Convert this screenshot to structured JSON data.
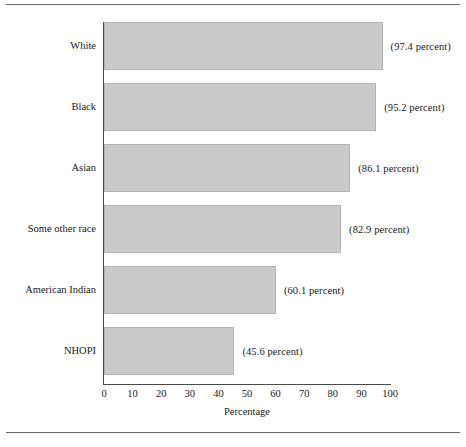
{
  "chart_data": {
    "type": "bar",
    "orientation": "horizontal",
    "title": "",
    "xlabel": "Percentage",
    "ylabel": "",
    "xlim": [
      0,
      100
    ],
    "xticks": [
      0,
      10,
      20,
      30,
      40,
      50,
      60,
      70,
      80,
      90,
      100
    ],
    "grid": false,
    "legend": null,
    "bar_color": "#c9c9c9",
    "bar_edge_color": "#b4b4b4",
    "categories": [
      "White",
      "Black",
      "Asian",
      "Some other race",
      "American Indian",
      "NHOPI"
    ],
    "values": [
      97.4,
      95.2,
      86.1,
      82.9,
      60.1,
      45.6
    ],
    "data_labels": [
      "(97.4 percent)",
      "(95.2 percent)",
      "(86.1 percent)",
      "(82.9 percent)",
      "(60.1 percent)",
      "(45.6 percent)"
    ]
  }
}
